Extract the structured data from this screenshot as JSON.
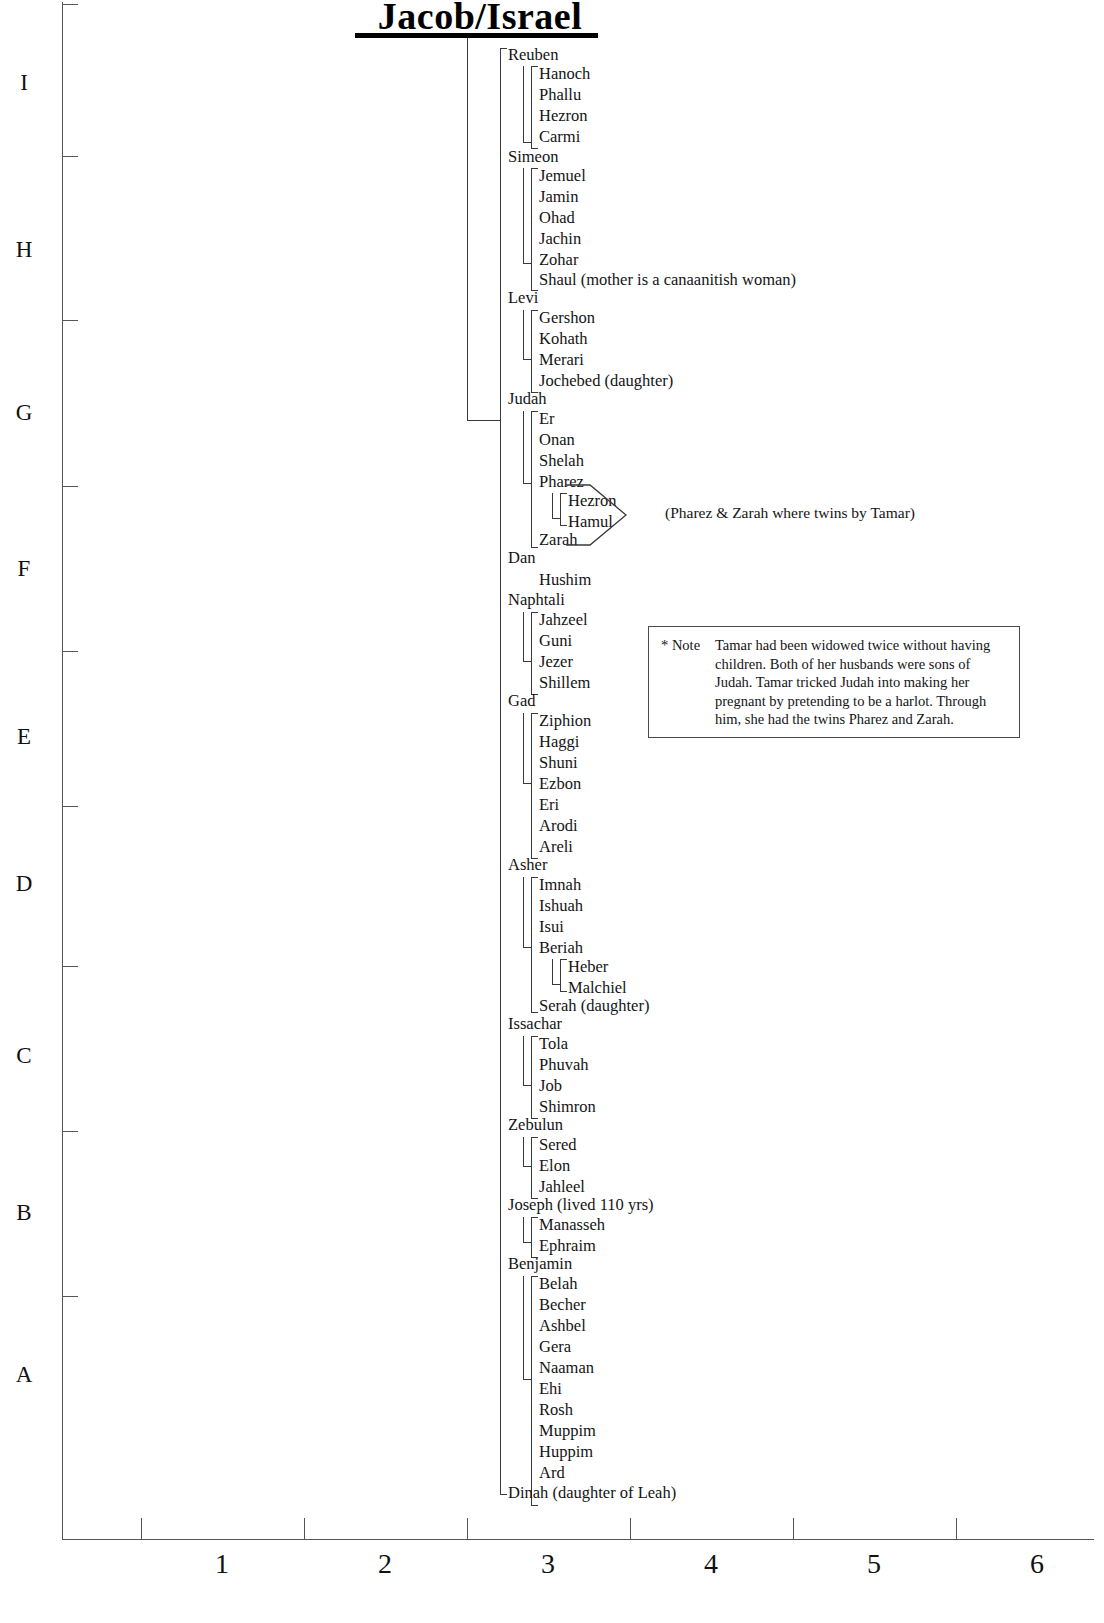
{
  "title": "Jacob/Israel",
  "axes": {
    "y_labels": [
      "I",
      "H",
      "G",
      "F",
      "E",
      "D",
      "C",
      "B",
      "A"
    ],
    "x_labels": [
      "1",
      "2",
      "3",
      "4",
      "5",
      "6"
    ]
  },
  "note": {
    "marker": "* Note",
    "text": "Tamar had been widowed twice without having children. Both of her husbands were sons of Judah. Tamar tricked Judah into making her pregnant by pretending to be a harlot. Through him, she had the twins Pharez and Zarah."
  },
  "twins_caption": "(Pharez & Zarah where twins by Tamar)",
  "tree": {
    "root": "Jacob/Israel",
    "children": [
      {
        "name": "Reuben",
        "children": [
          {
            "name": "Hanoch"
          },
          {
            "name": "Phallu"
          },
          {
            "name": "Hezron"
          },
          {
            "name": "Carmi"
          }
        ]
      },
      {
        "name": "Simeon",
        "children": [
          {
            "name": "Jemuel"
          },
          {
            "name": "Jamin"
          },
          {
            "name": "Ohad"
          },
          {
            "name": "Jachin"
          },
          {
            "name": "Zohar"
          },
          {
            "name": "Shaul  (mother is a canaanitish woman)"
          }
        ]
      },
      {
        "name": "Levi",
        "children": [
          {
            "name": "Gershon"
          },
          {
            "name": "Kohath"
          },
          {
            "name": "Merari"
          },
          {
            "name": "Jochebed  (daughter)"
          }
        ]
      },
      {
        "name": "Judah",
        "children": [
          {
            "name": "Er"
          },
          {
            "name": "Onan"
          },
          {
            "name": "Shelah"
          },
          {
            "name": "Pharez",
            "children": [
              {
                "name": "Hezron"
              },
              {
                "name": "Hamul"
              }
            ]
          },
          {
            "name": "Zarah"
          }
        ]
      },
      {
        "name": "Dan",
        "children": [
          {
            "name": "Hushim"
          }
        ]
      },
      {
        "name": "Naphtali",
        "children": [
          {
            "name": "Jahzeel"
          },
          {
            "name": "Guni"
          },
          {
            "name": "Jezer"
          },
          {
            "name": "Shillem"
          }
        ]
      },
      {
        "name": "Gad",
        "children": [
          {
            "name": "Ziphion"
          },
          {
            "name": "Haggi"
          },
          {
            "name": "Shuni"
          },
          {
            "name": "Ezbon"
          },
          {
            "name": "Eri"
          },
          {
            "name": "Arodi"
          },
          {
            "name": "Areli"
          }
        ]
      },
      {
        "name": "Asher",
        "children": [
          {
            "name": "Imnah"
          },
          {
            "name": "Ishuah"
          },
          {
            "name": "Isui"
          },
          {
            "name": "Beriah",
            "children": [
              {
                "name": "Heber"
              },
              {
                "name": "Malchiel"
              }
            ]
          },
          {
            "name": "Serah   (daughter)"
          }
        ]
      },
      {
        "name": "Issachar",
        "children": [
          {
            "name": "Tola"
          },
          {
            "name": "Phuvah"
          },
          {
            "name": "Job"
          },
          {
            "name": "Shimron"
          }
        ]
      },
      {
        "name": "Zebulun",
        "children": [
          {
            "name": "Sered"
          },
          {
            "name": "Elon"
          },
          {
            "name": "Jahleel"
          }
        ]
      },
      {
        "name": "Joseph   (lived 110 yrs)",
        "children": [
          {
            "name": "Manasseh"
          },
          {
            "name": "Ephraim"
          }
        ]
      },
      {
        "name": "Benjamin",
        "children": [
          {
            "name": "Belah"
          },
          {
            "name": "Becher"
          },
          {
            "name": "Ashbel"
          },
          {
            "name": "Gera"
          },
          {
            "name": "Naaman"
          },
          {
            "name": "Ehi"
          },
          {
            "name": "Rosh"
          },
          {
            "name": "Muppim"
          },
          {
            "name": "Huppim"
          },
          {
            "name": "Ard"
          }
        ]
      },
      {
        "name": "Dinah (daughter of Leah)"
      }
    ]
  },
  "nodes": {
    "reuben": "Reuben",
    "reuben_kids": [
      "Hanoch",
      "Phallu",
      "Hezron",
      "Carmi"
    ],
    "simeon": "Simeon",
    "simeon_kids": [
      "Jemuel",
      "Jamin",
      "Ohad",
      "Jachin",
      "Zohar",
      "Shaul  (mother is a canaanitish woman)"
    ],
    "levi": "Levi",
    "levi_kids": [
      "Gershon",
      "Kohath",
      "Merari",
      "Jochebed  (daughter)"
    ],
    "judah": "Judah",
    "judah_kids": [
      "Er",
      "Onan",
      "Shelah",
      "Pharez",
      "Zarah"
    ],
    "pharez_kids": [
      "Hezron",
      "Hamul"
    ],
    "dan": "Dan",
    "dan_kids": [
      "Hushim"
    ],
    "naphtali": "Naphtali",
    "naphtali_kids": [
      "Jahzeel",
      "Guni",
      "Jezer",
      "Shillem"
    ],
    "gad": "Gad",
    "gad_kids": [
      "Ziphion",
      "Haggi",
      "Shuni",
      "Ezbon",
      "Eri",
      "Arodi",
      "Areli"
    ],
    "asher": "Asher",
    "asher_kids": [
      "Imnah",
      "Ishuah",
      "Isui",
      "Beriah",
      "Serah   (daughter)"
    ],
    "beriah_kids": [
      "Heber",
      "Malchiel"
    ],
    "issachar": "Issachar",
    "issachar_kids": [
      "Tola",
      "Phuvah",
      "Job",
      "Shimron"
    ],
    "zebulun": "Zebulun",
    "zebulun_kids": [
      "Sered",
      "Elon",
      "Jahleel"
    ],
    "joseph": "Joseph   (lived 110 yrs)",
    "joseph_kids": [
      "Manasseh",
      "Ephraim"
    ],
    "benjamin": "Benjamin",
    "benjamin_kids": [
      "Belah",
      "Becher",
      "Ashbel",
      "Gera",
      "Naaman",
      "Ehi",
      "Rosh",
      "Muppim",
      "Huppim",
      "Ard"
    ],
    "dinah": "Dinah (daughter of Leah)"
  }
}
